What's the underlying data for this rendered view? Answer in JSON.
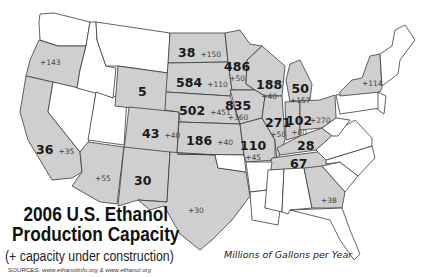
{
  "title_line1": "2006 U.S. Ethanol",
  "title_line2": "Production Capacity",
  "subtitle": "(+ capacity under construction)",
  "sources_label": "SOURCES:",
  "sources_text": "www.ethanolinfo.org & www.ethanol.org",
  "units": "Millions of Gallons per Year",
  "colors": {
    "capacity_fill": "#cfcfcf",
    "no_capacity_fill": "#ffffff",
    "border": "#3a3a3a"
  },
  "states": {
    "OR": {
      "capacity": "",
      "construction": "+143"
    },
    "CA": {
      "capacity": "36",
      "construction": "+35"
    },
    "AZ": {
      "capacity": "",
      "construction": "+55"
    },
    "NM": {
      "capacity": "30",
      "construction": ""
    },
    "TX": {
      "capacity": "",
      "construction": "+30"
    },
    "WY": {
      "capacity": "5",
      "construction": ""
    },
    "CO": {
      "capacity": "43",
      "construction": "+40"
    },
    "ND": {
      "capacity": "38",
      "construction": "+150"
    },
    "SD": {
      "capacity": "584",
      "construction": "+110"
    },
    "NE": {
      "capacity": "502",
      "construction": "+451"
    },
    "KS": {
      "capacity": "186",
      "construction": "+40"
    },
    "MN": {
      "capacity": "486",
      "construction": "+50"
    },
    "IA": {
      "capacity": "835",
      "construction": "+360"
    },
    "MO": {
      "capacity": "110",
      "construction": "+45"
    },
    "WI": {
      "capacity": "188",
      "construction": "+40"
    },
    "IL": {
      "capacity": "271",
      "construction": "+50"
    },
    "MI": {
      "capacity": "50",
      "construction": "+157"
    },
    "IN": {
      "capacity": "102",
      "construction": "+80"
    },
    "OH": {
      "capacity": "",
      "construction": "+270"
    },
    "KY": {
      "capacity": "28",
      "construction": ""
    },
    "TN": {
      "capacity": "67",
      "construction": ""
    },
    "GA": {
      "capacity": "",
      "construction": "+38"
    },
    "NY": {
      "capacity": "",
      "construction": "+114"
    }
  }
}
